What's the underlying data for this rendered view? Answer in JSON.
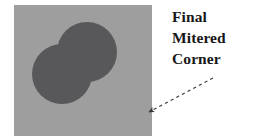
{
  "figure": {
    "name": "final-mitered-corner-illustration",
    "background_color": "#ffffff",
    "panel": {
      "name": "gray-square-panel",
      "fill_color": "#9e9e9e",
      "x": 14,
      "y": 5,
      "width": 138,
      "height": 131
    },
    "shape": {
      "name": "two-circle-union",
      "description": "union of two overlapping circles forming a mitered corner",
      "fill_color": "#58585a",
      "circles": [
        {
          "name": "upper-right-circle",
          "cx": 87,
          "cy": 52,
          "r": 30
        },
        {
          "name": "lower-left-circle",
          "cx": 62,
          "cy": 74,
          "r": 30
        }
      ]
    },
    "arrow": {
      "name": "dashed-pointer-arrow",
      "color": "#3a3a3a",
      "style": "dashed",
      "tail_x": 213,
      "tail_y": 78,
      "tip_x": 146,
      "tip_y": 114
    }
  },
  "annotation": {
    "lines": [
      "Final",
      "Mitered",
      "Corner"
    ],
    "full_text": "Final Mitered Corner",
    "color": "#171717"
  }
}
